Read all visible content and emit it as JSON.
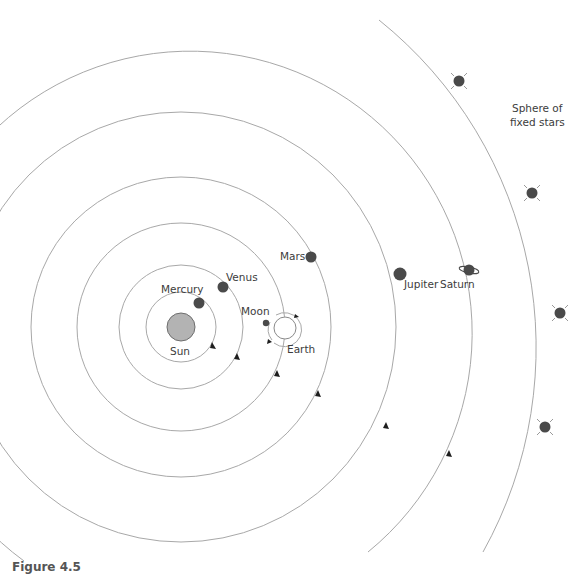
{
  "diagram": {
    "labels": {
      "sun": "Sun",
      "mercury": "Mercury",
      "venus": "Venus",
      "earth": "Earth",
      "moon": "Moon",
      "mars": "Mars",
      "jupiter": "Jupiter",
      "saturn": "Saturn",
      "sphere_line1": "Sphere of",
      "sphere_line2": "fixed stars"
    },
    "colors": {
      "orbit": "#a8a8a8",
      "planet": "#4a4a4a",
      "sun": "#b3b3b3",
      "text": "#3c3c3c"
    },
    "caption": "Figure 4.5"
  }
}
